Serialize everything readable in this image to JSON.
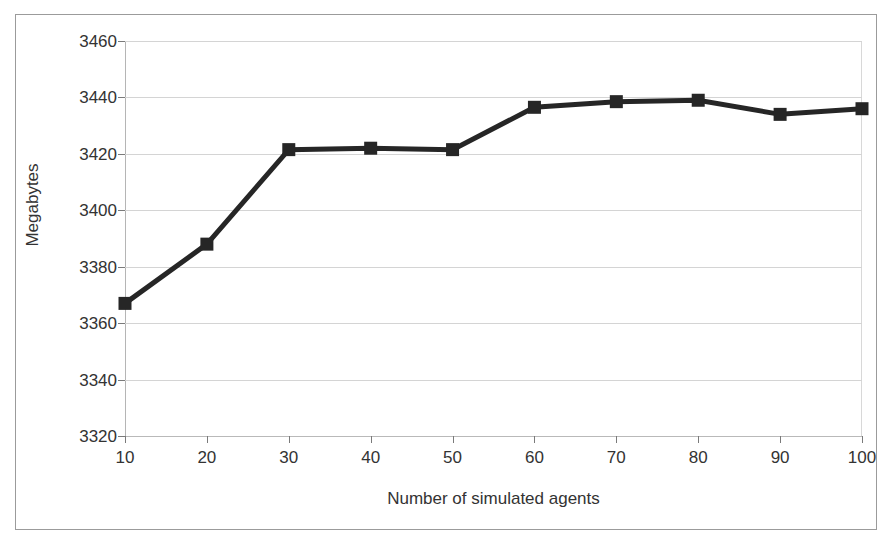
{
  "chart_data": {
    "type": "line",
    "title": "",
    "xlabel": "Number of simulated agents",
    "ylabel": "Megabytes",
    "x": [
      10,
      20,
      30,
      40,
      50,
      60,
      70,
      80,
      90,
      100
    ],
    "values": [
      3367,
      3388,
      3421.5,
      3422,
      3421.5,
      3436.5,
      3438.5,
      3439,
      3434,
      3436
    ],
    "series": [
      {
        "name": "Memory usage",
        "values": [
          3367,
          3388,
          3421.5,
          3422,
          3421.5,
          3436.5,
          3438.5,
          3439,
          3434,
          3436
        ]
      }
    ],
    "xtick_labels": [
      "10",
      "20",
      "30",
      "40",
      "50",
      "60",
      "70",
      "80",
      "90",
      "100"
    ],
    "ytick_labels": [
      "3460",
      "3440",
      "3420",
      "3400",
      "3380",
      "3360",
      "3340",
      "3320"
    ],
    "yticks": [
      3460,
      3440,
      3420,
      3400,
      3380,
      3360,
      3340,
      3320
    ],
    "ylim": [
      3320,
      3460
    ],
    "xlim": [
      10,
      100
    ],
    "grid": "horizontal",
    "legend": "none",
    "marker": "square",
    "series_color": "#262626",
    "grid_color": "#d4d4d4",
    "axis_color": "#7a7a7a",
    "text_color": "#333333",
    "frame_color": "#9b9b9b",
    "background": "#ffffff"
  }
}
